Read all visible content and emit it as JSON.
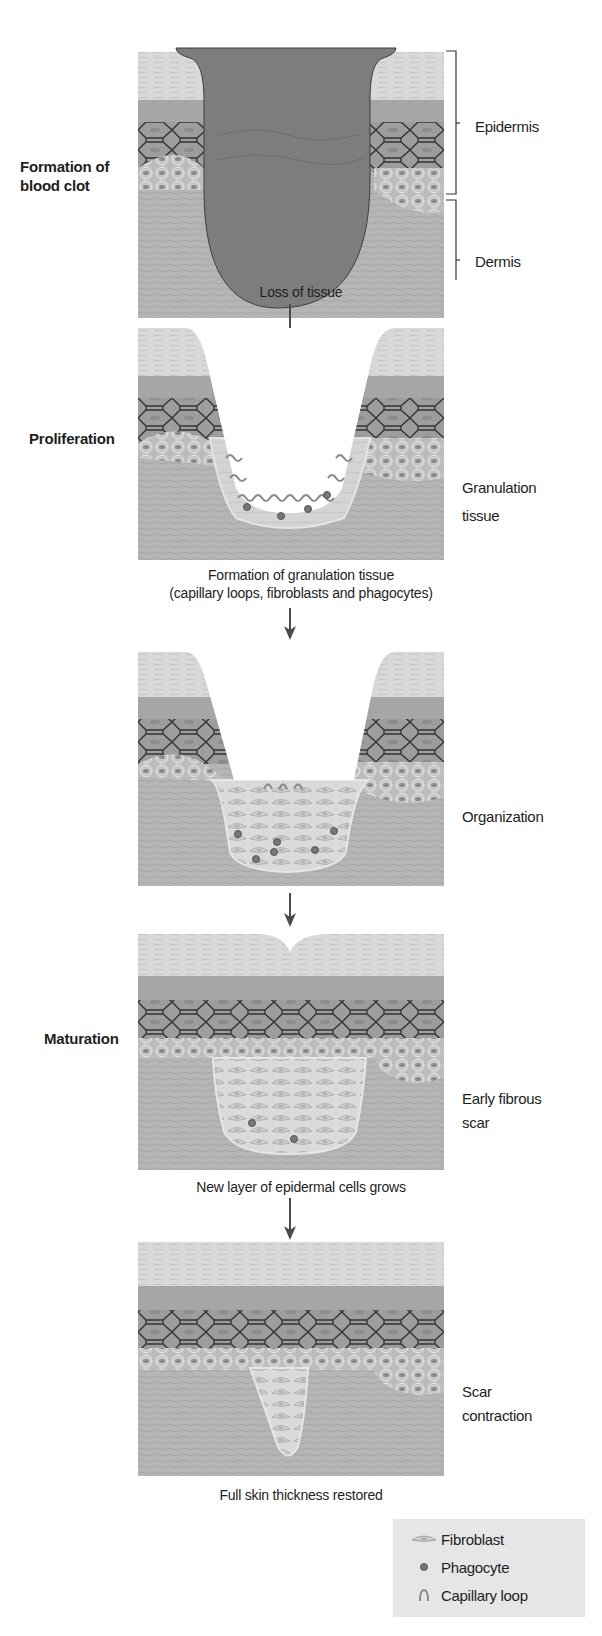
{
  "figure": {
    "stages": [
      {
        "id": "blood-clot",
        "stage_label": "Formation of\nblood clot",
        "stage_label_lines": [
          "Formation of",
          "blood clot"
        ],
        "caption": "Loss of tissue",
        "side_label_lines": []
      },
      {
        "id": "proliferation",
        "stage_label": "Proliferation",
        "stage_label_lines": [
          "Proliferation"
        ],
        "caption_lines": [
          "Formation of granulation tissue",
          "(capillary loops, fibroblasts and phagocytes)"
        ],
        "side_label_lines": [
          "Granulation",
          "tissue"
        ]
      },
      {
        "id": "organization",
        "stage_label_lines": [],
        "side_label_lines": [
          "Organization"
        ]
      },
      {
        "id": "maturation",
        "stage_label": "Maturation",
        "stage_label_lines": [
          "Maturation"
        ],
        "caption": "New layer of epidermal cells grows",
        "side_label_lines": [
          "Early fibrous",
          "scar"
        ]
      },
      {
        "id": "scar-contraction",
        "stage_label_lines": [],
        "caption": "Full skin thickness restored",
        "side_label_lines": [
          "Scar",
          "contraction"
        ]
      }
    ],
    "layer_brackets": [
      {
        "label": "Epidermis"
      },
      {
        "label": "Dermis"
      }
    ],
    "legend": {
      "items": [
        {
          "icon": "fibroblast-icon",
          "label": "Fibroblast"
        },
        {
          "icon": "phagocyte-icon",
          "label": "Phagocyte"
        },
        {
          "icon": "capillary-loop-icon",
          "label": "Capillary loop"
        }
      ]
    },
    "colors": {
      "background": "#ffffff",
      "stratum_corneum": "#d6d6d6",
      "epidermis_mid": "#a9a9a9",
      "spinous_cells": "#9a9a9a",
      "cell_outline": "#3a3a3a",
      "dermis": "#b3b3b3",
      "blood_clot": "#7d7d7d",
      "granulation": "#d9d9d9",
      "phagocyte": "#777777",
      "capillary_loop": "#8a8a8a",
      "arrow": "#4a4a4a",
      "legend_bg": "#e6e6e6",
      "text": "#1e1e1e"
    }
  }
}
